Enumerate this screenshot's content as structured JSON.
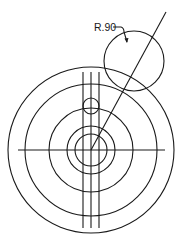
{
  "drawing": {
    "title": "Concentric circles with radius callout",
    "dimension_label": "R.90",
    "colors": {
      "line": "#1a1a1a",
      "background": "#ffffff"
    }
  }
}
